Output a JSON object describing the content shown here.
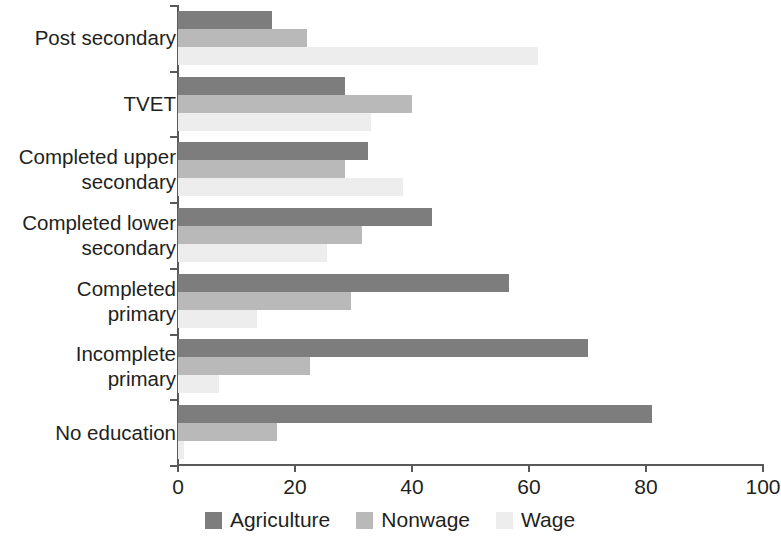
{
  "chart_data": {
    "type": "bar",
    "orientation": "horizontal",
    "title": "",
    "xlabel": "",
    "ylabel": "",
    "xlim": [
      0,
      100
    ],
    "xticks": [
      0,
      20,
      40,
      60,
      80,
      100
    ],
    "xtick_labels": [
      "0",
      "20",
      "40",
      "60",
      "80",
      "100"
    ],
    "grid": false,
    "legend_position": "bottom-center",
    "categories": [
      "Post secondary",
      "TVET",
      "Completed upper\nsecondary",
      "Completed lower\nsecondary",
      "Completed\nprimary",
      "Incomplete\nprimary",
      "No education"
    ],
    "series": [
      {
        "name": "Agriculture",
        "color": "#7d7d7d",
        "values": [
          16,
          28.5,
          32.5,
          43.5,
          56.5,
          70,
          81
        ]
      },
      {
        "name": "Nonwage",
        "color": "#b9b9b9",
        "values": [
          22,
          40,
          28.5,
          31.5,
          29.5,
          22.5,
          17
        ]
      },
      {
        "name": "Wage",
        "color": "#ededed",
        "values": [
          61.5,
          33,
          38.5,
          25.5,
          13.5,
          7,
          1
        ]
      }
    ]
  },
  "legend": {
    "items": [
      {
        "label": "Agriculture",
        "color": "#7d7d7d"
      },
      {
        "label": "Nonwage",
        "color": "#b9b9b9"
      },
      {
        "label": "Wage",
        "color": "#ededed"
      }
    ]
  }
}
